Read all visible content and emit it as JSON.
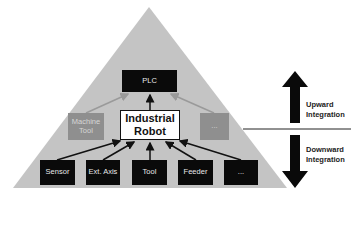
{
  "colors": {
    "pyramid": "#c4c4c4",
    "dark_box": "#0a0a0a",
    "gray_box": "#8f8f8f",
    "arrow_dark": "#111111",
    "arrow_gray": "#9a9a9a"
  },
  "top": {
    "plc": "PLC"
  },
  "middle": {
    "left": "Machine Tool",
    "center_line1": "Industrial",
    "center_line2": "Robot",
    "right": "..."
  },
  "bottom": {
    "items": [
      "Sensor",
      "Ext. Axis",
      "Tool",
      "Feeder",
      "..."
    ]
  },
  "legend": {
    "up_line1": "Upward",
    "up_line2": "Integration",
    "down_line1": "Downward",
    "down_line2": "Integration"
  }
}
